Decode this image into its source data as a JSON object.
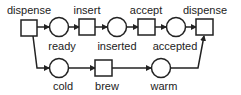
{
  "diagram": {
    "type": "petri-net",
    "transitions": [
      {
        "id": "t1",
        "label": "dispense",
        "x": 21,
        "y": 20,
        "w": 16,
        "h": 16
      },
      {
        "id": "t2",
        "label": "insert",
        "x": 79,
        "y": 19,
        "w": 16,
        "h": 16
      },
      {
        "id": "t3",
        "label": "accept",
        "x": 138,
        "y": 19,
        "w": 17,
        "h": 16
      },
      {
        "id": "t4",
        "label": "dispense",
        "x": 196,
        "y": 19,
        "w": 17,
        "h": 16
      },
      {
        "id": "t5",
        "label": "brew",
        "x": 95,
        "y": 60,
        "w": 17,
        "h": 16
      }
    ],
    "places": [
      {
        "id": "p1",
        "label": "ready",
        "cx": 59,
        "cy": 27,
        "r": 9.5
      },
      {
        "id": "p2",
        "label": "inserted",
        "cx": 117,
        "cy": 27,
        "r": 9.5
      },
      {
        "id": "p3",
        "label": "accepted",
        "cx": 176,
        "cy": 27,
        "r": 9.5
      },
      {
        "id": "p4",
        "label": "cold",
        "cx": 59,
        "cy": 68,
        "r": 9.5
      },
      {
        "id": "p5",
        "label": "warm",
        "cx": 161,
        "cy": 68,
        "r": 9.5
      }
    ],
    "arcs": [
      {
        "from": "dispense",
        "to": "ready"
      },
      {
        "from": "ready",
        "to": "insert"
      },
      {
        "from": "insert",
        "to": "inserted"
      },
      {
        "from": "inserted",
        "to": "accept"
      },
      {
        "from": "accept",
        "to": "accepted"
      },
      {
        "from": "accepted",
        "to": "dispense"
      },
      {
        "from": "dispense",
        "to": "cold"
      },
      {
        "from": "cold",
        "to": "brew"
      },
      {
        "from": "brew",
        "to": "warm"
      },
      {
        "from": "warm",
        "to": "dispense"
      }
    ],
    "colors": {
      "stroke": "#222222",
      "fill": "#ffffff",
      "text": "#222222"
    }
  },
  "labels": {
    "t1": "dispense",
    "t2": "insert",
    "t3": "accept",
    "t4": "dispense",
    "t5": "brew",
    "p1": "ready",
    "p2": "inserted",
    "p3": "accepted",
    "p4": "cold",
    "p5": "warm"
  }
}
